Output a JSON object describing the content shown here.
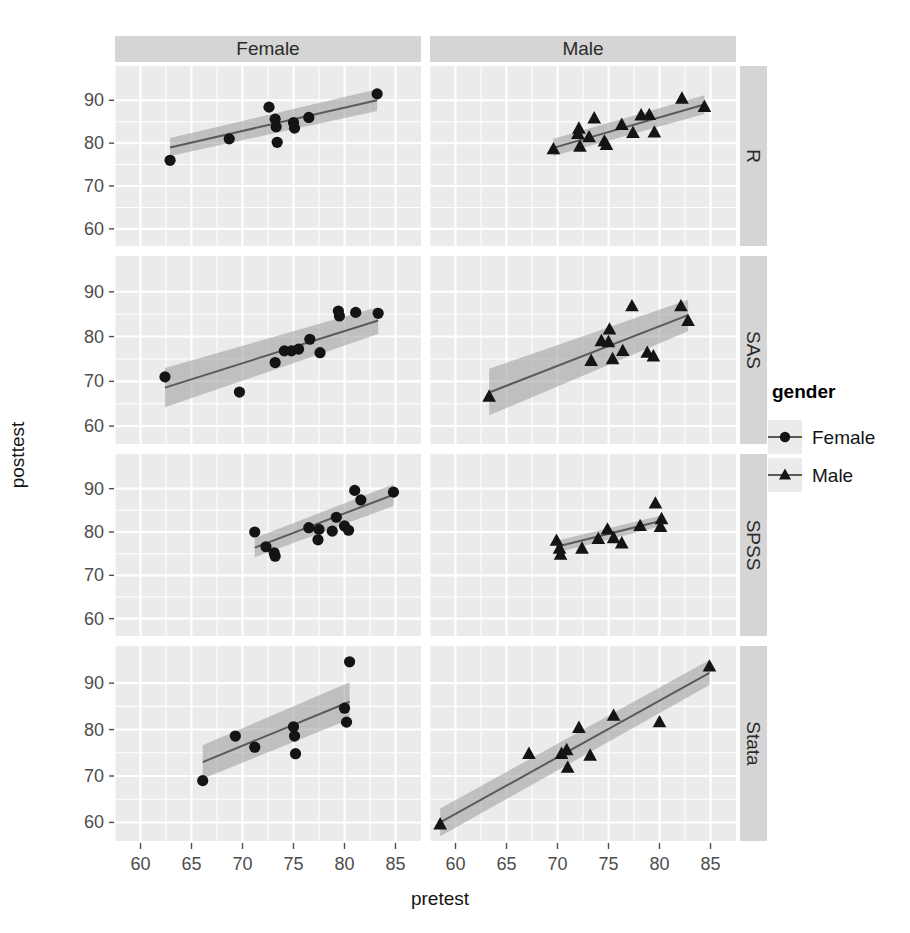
{
  "chart_data": {
    "type": "scatter",
    "title": "",
    "xlabel": "pretest",
    "ylabel": "posttest",
    "xlim": [
      57.5,
      87.5
    ],
    "ylim": [
      56,
      98
    ],
    "xticks": [
      60,
      65,
      70,
      75,
      80,
      85
    ],
    "yticks": [
      60,
      70,
      80,
      90
    ],
    "grid": true,
    "facet_cols": [
      "Female",
      "Male"
    ],
    "facet_rows": [
      "R",
      "SAS",
      "SPSS",
      "Stata"
    ],
    "legend": {
      "title": "gender",
      "position": "right",
      "entries": [
        {
          "name": "Female",
          "marker": "circle"
        },
        {
          "name": "Male",
          "marker": "triangle"
        }
      ]
    },
    "series": [
      {
        "name": "R / Female",
        "row": "R",
        "col": "Female",
        "marker": "circle",
        "points": [
          {
            "x": 62.9,
            "y": 76.0
          },
          {
            "x": 68.7,
            "y": 81.0
          },
          {
            "x": 72.6,
            "y": 88.4
          },
          {
            "x": 73.2,
            "y": 85.6
          },
          {
            "x": 73.3,
            "y": 83.8
          },
          {
            "x": 73.4,
            "y": 80.2
          },
          {
            "x": 75.0,
            "y": 84.8
          },
          {
            "x": 75.1,
            "y": 83.5
          },
          {
            "x": 76.5,
            "y": 86.0
          },
          {
            "x": 83.2,
            "y": 91.5
          }
        ],
        "fit": {
          "x0": 62.9,
          "y0": 79.0,
          "x1": 83.2,
          "y1": 90.0
        },
        "band": {
          "lo0": 77.0,
          "hi0": 81.2,
          "lo1": 87.5,
          "hi1": 92.6
        }
      },
      {
        "name": "R / Male",
        "row": "R",
        "col": "Male",
        "marker": "triangle",
        "points": [
          {
            "x": 69.6,
            "y": 78.6
          },
          {
            "x": 72.0,
            "y": 82.2
          },
          {
            "x": 72.1,
            "y": 83.4
          },
          {
            "x": 72.2,
            "y": 79.2
          },
          {
            "x": 73.1,
            "y": 81.4
          },
          {
            "x": 73.6,
            "y": 85.8
          },
          {
            "x": 74.6,
            "y": 80.4
          },
          {
            "x": 74.8,
            "y": 79.6
          },
          {
            "x": 76.3,
            "y": 84.3
          },
          {
            "x": 77.4,
            "y": 82.4
          },
          {
            "x": 78.2,
            "y": 86.5
          },
          {
            "x": 79.0,
            "y": 86.6
          },
          {
            "x": 79.5,
            "y": 82.5
          },
          {
            "x": 82.2,
            "y": 90.4
          },
          {
            "x": 84.4,
            "y": 88.5
          }
        ],
        "fit": {
          "x0": 69.6,
          "y0": 78.9,
          "x1": 84.4,
          "y1": 89.0
        },
        "band": {
          "lo0": 77.0,
          "hi0": 81.0,
          "lo1": 86.8,
          "hi1": 91.2
        }
      },
      {
        "name": "SAS / Female",
        "row": "SAS",
        "col": "Female",
        "marker": "circle",
        "points": [
          {
            "x": 62.4,
            "y": 71.0
          },
          {
            "x": 69.7,
            "y": 67.6
          },
          {
            "x": 73.2,
            "y": 74.2
          },
          {
            "x": 74.1,
            "y": 76.8
          },
          {
            "x": 74.8,
            "y": 76.8
          },
          {
            "x": 75.5,
            "y": 77.2
          },
          {
            "x": 76.6,
            "y": 79.4
          },
          {
            "x": 77.6,
            "y": 76.4
          },
          {
            "x": 79.4,
            "y": 85.7
          },
          {
            "x": 79.5,
            "y": 84.6
          },
          {
            "x": 81.1,
            "y": 85.4
          },
          {
            "x": 83.3,
            "y": 85.2
          }
        ],
        "fit": {
          "x0": 62.4,
          "y0": 68.6,
          "x1": 83.3,
          "y1": 83.6
        },
        "band": {
          "lo0": 64.2,
          "hi0": 73.0,
          "lo1": 80.6,
          "hi1": 86.6
        }
      },
      {
        "name": "SAS / Male",
        "row": "SAS",
        "col": "Male",
        "marker": "triangle",
        "points": [
          {
            "x": 63.3,
            "y": 66.6
          },
          {
            "x": 73.3,
            "y": 74.6
          },
          {
            "x": 74.3,
            "y": 79.0
          },
          {
            "x": 75.0,
            "y": 78.8
          },
          {
            "x": 75.1,
            "y": 81.6
          },
          {
            "x": 75.4,
            "y": 75.0
          },
          {
            "x": 76.4,
            "y": 76.8
          },
          {
            "x": 77.3,
            "y": 86.8
          },
          {
            "x": 78.8,
            "y": 76.4
          },
          {
            "x": 79.4,
            "y": 75.6
          },
          {
            "x": 82.1,
            "y": 86.8
          },
          {
            "x": 82.8,
            "y": 83.5
          }
        ],
        "fit": {
          "x0": 63.3,
          "y0": 67.5,
          "x1": 82.8,
          "y1": 84.8
        },
        "band": {
          "lo0": 62.4,
          "hi0": 72.8,
          "lo1": 81.2,
          "hi1": 88.2
        }
      },
      {
        "name": "SPSS / Female",
        "row": "SPSS",
        "col": "Female",
        "marker": "circle",
        "points": [
          {
            "x": 71.2,
            "y": 80.0
          },
          {
            "x": 72.3,
            "y": 76.6
          },
          {
            "x": 73.1,
            "y": 75.2
          },
          {
            "x": 73.2,
            "y": 74.4
          },
          {
            "x": 76.5,
            "y": 81.0
          },
          {
            "x": 77.4,
            "y": 78.2
          },
          {
            "x": 77.5,
            "y": 80.6
          },
          {
            "x": 78.8,
            "y": 80.2
          },
          {
            "x": 79.2,
            "y": 83.4
          },
          {
            "x": 80.0,
            "y": 81.4
          },
          {
            "x": 80.4,
            "y": 80.4
          },
          {
            "x": 81.0,
            "y": 89.6
          },
          {
            "x": 81.6,
            "y": 87.4
          },
          {
            "x": 84.8,
            "y": 89.2
          }
        ],
        "fit": {
          "x0": 71.2,
          "y0": 76.4,
          "x1": 84.8,
          "y1": 88.6
        },
        "band": {
          "lo0": 74.2,
          "hi0": 78.6,
          "lo1": 86.0,
          "hi1": 91.0
        }
      },
      {
        "name": "SPSS / Male",
        "row": "SPSS",
        "col": "Male",
        "marker": "triangle",
        "points": [
          {
            "x": 69.9,
            "y": 78.0
          },
          {
            "x": 70.2,
            "y": 76.2
          },
          {
            "x": 70.3,
            "y": 74.8
          },
          {
            "x": 72.4,
            "y": 76.2
          },
          {
            "x": 74.0,
            "y": 78.4
          },
          {
            "x": 74.9,
            "y": 80.6
          },
          {
            "x": 75.5,
            "y": 78.6
          },
          {
            "x": 76.3,
            "y": 77.4
          },
          {
            "x": 78.1,
            "y": 81.4
          },
          {
            "x": 79.6,
            "y": 86.6
          },
          {
            "x": 80.1,
            "y": 81.2
          },
          {
            "x": 80.2,
            "y": 83.0
          }
        ],
        "fit": {
          "x0": 69.9,
          "y0": 76.6,
          "x1": 80.2,
          "y1": 82.6
        },
        "band": {
          "lo0": 75.2,
          "hi0": 78.0,
          "lo1": 81.4,
          "hi1": 83.8
        }
      },
      {
        "name": "Stata / Female",
        "row": "Stata",
        "col": "Female",
        "marker": "circle",
        "points": [
          {
            "x": 66.1,
            "y": 69.0
          },
          {
            "x": 69.3,
            "y": 78.6
          },
          {
            "x": 71.2,
            "y": 76.2
          },
          {
            "x": 75.0,
            "y": 80.6
          },
          {
            "x": 75.1,
            "y": 78.6
          },
          {
            "x": 75.2,
            "y": 74.8
          },
          {
            "x": 80.0,
            "y": 84.6
          },
          {
            "x": 80.2,
            "y": 81.6
          },
          {
            "x": 80.5,
            "y": 94.6
          }
        ],
        "fit": {
          "x0": 66.1,
          "y0": 73.0,
          "x1": 80.5,
          "y1": 86.0
        },
        "band": {
          "lo0": 69.4,
          "hi0": 76.6,
          "lo1": 82.2,
          "hi1": 90.2
        }
      },
      {
        "name": "Stata / Male",
        "row": "Stata",
        "col": "Male",
        "marker": "triangle",
        "points": [
          {
            "x": 58.5,
            "y": 59.6
          },
          {
            "x": 67.2,
            "y": 74.8
          },
          {
            "x": 70.4,
            "y": 74.8
          },
          {
            "x": 70.9,
            "y": 75.6
          },
          {
            "x": 71.0,
            "y": 71.8
          },
          {
            "x": 72.1,
            "y": 80.4
          },
          {
            "x": 73.2,
            "y": 74.4
          },
          {
            "x": 75.5,
            "y": 83.0
          },
          {
            "x": 80.0,
            "y": 81.6
          },
          {
            "x": 84.9,
            "y": 93.6
          }
        ],
        "fit": {
          "x0": 58.5,
          "y0": 60.0,
          "x1": 84.9,
          "y1": 92.2
        },
        "band": {
          "lo0": 57.0,
          "hi0": 63.0,
          "lo1": 89.6,
          "hi1": 95.0
        }
      }
    ]
  }
}
